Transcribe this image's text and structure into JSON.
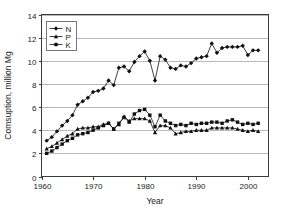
{
  "chart_data": {
    "type": "line",
    "title": "",
    "xlabel": "Year",
    "ylabel": "Comsuption, million Mg",
    "xlim": [
      1960,
      2004
    ],
    "ylim": [
      0,
      14
    ],
    "xticks": [
      1960,
      1970,
      1980,
      1990,
      2000
    ],
    "yticks": [
      0,
      2,
      4,
      6,
      8,
      10,
      12,
      14
    ],
    "grid": "horizontal",
    "legend_position": "upper-left",
    "markers": {
      "N": "diamond",
      "P": "triangle",
      "K": "square"
    },
    "x": [
      1961,
      1962,
      1963,
      1964,
      1965,
      1966,
      1967,
      1968,
      1969,
      1970,
      1971,
      1972,
      1973,
      1974,
      1975,
      1976,
      1977,
      1978,
      1979,
      1980,
      1981,
      1982,
      1983,
      1984,
      1985,
      1986,
      1987,
      1988,
      1989,
      1990,
      1991,
      1992,
      1993,
      1994,
      1995,
      1996,
      1997,
      1998,
      1999,
      2000,
      2001,
      2002
    ],
    "series": [
      {
        "name": "N",
        "marker": "diamond",
        "values": [
          3.1,
          3.4,
          3.9,
          4.4,
          4.8,
          5.3,
          6.2,
          6.5,
          6.8,
          7.3,
          7.4,
          7.6,
          8.3,
          7.9,
          9.4,
          9.5,
          9.1,
          9.9,
          10.4,
          10.8,
          10.0,
          8.3,
          10.4,
          10.1,
          9.4,
          9.3,
          9.6,
          9.5,
          9.8,
          10.2,
          10.3,
          10.4,
          11.5,
          10.7,
          11.1,
          11.2,
          11.2,
          11.2,
          11.3,
          10.5,
          10.9,
          10.9
        ]
      },
      {
        "name": "P",
        "marker": "triangle",
        "values": [
          2.4,
          2.6,
          2.9,
          3.2,
          3.5,
          3.7,
          4.1,
          4.2,
          4.2,
          4.3,
          4.3,
          4.5,
          4.6,
          4.1,
          4.5,
          5.2,
          4.8,
          5.0,
          5.0,
          5.0,
          4.8,
          3.8,
          4.4,
          4.4,
          4.2,
          3.7,
          3.8,
          3.9,
          3.9,
          4.0,
          4.0,
          4.0,
          4.2,
          4.2,
          4.2,
          4.2,
          4.2,
          4.1,
          4.0,
          3.9,
          4.0,
          3.9
        ]
      },
      {
        "name": "K",
        "marker": "square",
        "values": [
          2.0,
          2.2,
          2.5,
          2.8,
          3.1,
          3.3,
          3.6,
          3.7,
          3.8,
          4.0,
          4.2,
          4.4,
          4.6,
          4.1,
          4.6,
          5.1,
          4.7,
          5.4,
          5.7,
          5.8,
          5.3,
          4.3,
          5.3,
          4.8,
          4.6,
          4.4,
          4.5,
          4.4,
          4.6,
          4.5,
          4.6,
          4.6,
          4.7,
          4.7,
          4.6,
          4.8,
          4.9,
          4.7,
          4.5,
          4.6,
          4.5,
          4.6
        ]
      }
    ],
    "legend": [
      "N",
      "P",
      "K"
    ]
  }
}
